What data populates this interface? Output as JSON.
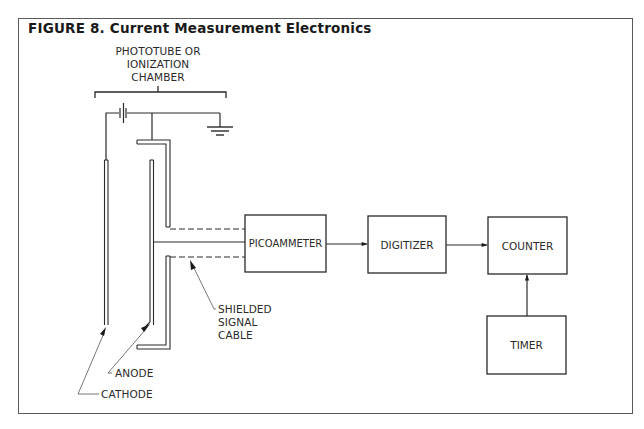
{
  "figure": {
    "title": "FIGURE 8. Current Measurement Electronics",
    "detector_label": {
      "line1": "PHOTOTUBE OR",
      "line2": "IONIZATION",
      "line3": "CHAMBER"
    },
    "electrodes": {
      "anode": "ANODE",
      "cathode": "CATHODE"
    },
    "cable_label": {
      "line1": "SHIELDED",
      "line2": "SIGNAL",
      "line3": "CABLE"
    },
    "blocks": [
      {
        "id": "picoammeter",
        "label": "PICOAMMETER"
      },
      {
        "id": "digitizer",
        "label": "DIGITIZER"
      },
      {
        "id": "counter",
        "label": "COUNTER"
      },
      {
        "id": "timer",
        "label": "TIMER"
      }
    ],
    "connections": [
      {
        "from": "detector",
        "to": "picoammeter",
        "via": "SHIELDED SIGNAL CABLE"
      },
      {
        "from": "picoammeter",
        "to": "digitizer"
      },
      {
        "from": "digitizer",
        "to": "counter"
      },
      {
        "from": "timer",
        "to": "counter"
      }
    ],
    "colors": {
      "line": "#2a2a2a",
      "frame": "#5a5a5a",
      "background": "#ffffff"
    }
  }
}
